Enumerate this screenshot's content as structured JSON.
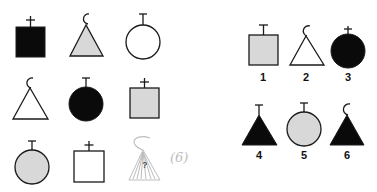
{
  "puzzle": {
    "type": "visual-analogy-matrix",
    "colors": {
      "black": "#0a0a0a",
      "gray": "#d8d8d8",
      "white": "#ffffff",
      "stroke": "#1a1a1a",
      "sketch": "#bdbdbd"
    },
    "matrix": [
      [
        {
          "shape": "square",
          "fill": "black",
          "top": "plus"
        },
        {
          "shape": "triangle",
          "fill": "gray",
          "top": "hook"
        },
        {
          "shape": "circle",
          "fill": "white",
          "top": "t-bar"
        }
      ],
      [
        {
          "shape": "triangle",
          "fill": "white",
          "top": "hook"
        },
        {
          "shape": "circle",
          "fill": "black",
          "top": "t-bar"
        },
        {
          "shape": "square",
          "fill": "gray",
          "top": "plus"
        }
      ],
      [
        {
          "shape": "circle",
          "fill": "gray",
          "top": "t-bar"
        },
        {
          "shape": "square",
          "fill": "white",
          "top": "plus"
        },
        {
          "shape": "missing",
          "sketch": "triangle",
          "top": "hook",
          "mark": "?"
        }
      ]
    ],
    "handwritten_answer": "(6)",
    "question_mark": "?",
    "options": [
      {
        "label": "1",
        "shape": "square",
        "fill": "gray",
        "top": "t-bar"
      },
      {
        "label": "2",
        "shape": "triangle",
        "fill": "white",
        "top": "hook"
      },
      {
        "label": "3",
        "shape": "circle",
        "fill": "black",
        "top": "plus"
      },
      {
        "label": "4",
        "shape": "triangle",
        "fill": "black",
        "top": "t-bar"
      },
      {
        "label": "5",
        "shape": "circle",
        "fill": "gray",
        "top": "t-bar"
      },
      {
        "label": "6",
        "shape": "triangle",
        "fill": "black",
        "top": "hook"
      }
    ]
  }
}
